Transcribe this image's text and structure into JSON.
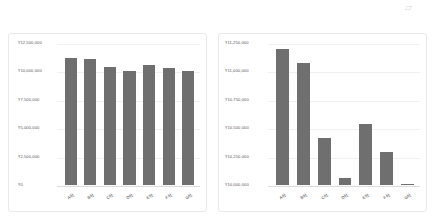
{
  "corner_mark": "▱",
  "charts": [
    {
      "id": "chart-left",
      "chart_data": {
        "type": "bar",
        "title": "",
        "xlabel": "",
        "ylabel": "",
        "categories": [
          "A社",
          "B社",
          "C社",
          "D社",
          "E社",
          "F社",
          "G社"
        ],
        "values": [
          11200000,
          11075000,
          10415000,
          10065000,
          10540000,
          10290000,
          10010000
        ],
        "ylim": [
          0,
          12500000
        ],
        "yticks": [
          0,
          2500000,
          5000000,
          7500000,
          10000000,
          12500000
        ],
        "ytick_labels": [
          "¥0",
          "¥2,500,000",
          "¥5,000,000",
          "¥7,500,000",
          "¥10,000,000",
          "¥12,500,000"
        ],
        "grid": true,
        "legend": "none",
        "bar_color": "#706f6f"
      }
    },
    {
      "id": "chart-right",
      "chart_data": {
        "type": "bar",
        "title": "",
        "xlabel": "",
        "ylabel": "",
        "categories": [
          "A社",
          "B社",
          "C社",
          "D社",
          "E社",
          "F社",
          "G社"
        ],
        "values": [
          11200000,
          11075000,
          10415000,
          10065000,
          10540000,
          10290000,
          10010000
        ],
        "ylim": [
          10000000,
          11250000
        ],
        "yticks": [
          10000000,
          10250000,
          10500000,
          10750000,
          11000000,
          11250000
        ],
        "ytick_labels": [
          "¥10,000,000",
          "¥10,250,000",
          "¥10,500,000",
          "¥10,750,000",
          "¥11,000,000",
          "¥11,250,000"
        ],
        "grid": true,
        "legend": "none",
        "bar_color": "#706f6f"
      }
    }
  ]
}
